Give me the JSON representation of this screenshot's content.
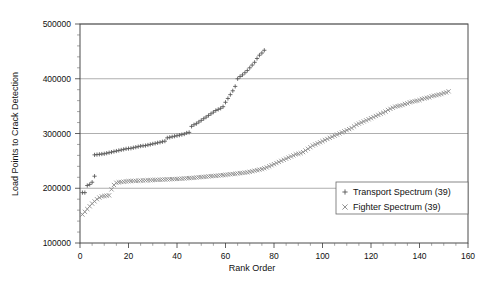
{
  "chart_data": {
    "type": "scatter",
    "title": "",
    "xlabel": "Rank Order",
    "ylabel": "Load Points to Crack Detection",
    "xlim": [
      0,
      160
    ],
    "ylim": [
      100000,
      500000
    ],
    "xticks": [
      0,
      20,
      40,
      60,
      80,
      100,
      120,
      140,
      160
    ],
    "xtick_labels": [
      "0",
      "20",
      "40",
      "60",
      "80",
      "100",
      "120",
      "140",
      "160"
    ],
    "yticks": [
      100000,
      200000,
      300000,
      400000,
      500000
    ],
    "ytick_labels": [
      "100000",
      "200000",
      "300000",
      "400000",
      "500000"
    ],
    "grid": "horizontal",
    "legend_position": "lower-right",
    "series": [
      {
        "name": "Transport Spectrum (39)",
        "marker": "plus",
        "color": "#555555",
        "count_label": "39",
        "points": [
          [
            1,
            192000
          ],
          [
            2,
            192000
          ],
          [
            3,
            205000
          ],
          [
            4,
            207000
          ],
          [
            5,
            211000
          ],
          [
            6,
            222000
          ],
          [
            6,
            261000
          ],
          [
            7,
            261500
          ],
          [
            8,
            262000
          ],
          [
            9,
            262500
          ],
          [
            10,
            263000
          ],
          [
            11,
            264000
          ],
          [
            12,
            265000
          ],
          [
            13,
            266000
          ],
          [
            14,
            267000
          ],
          [
            15,
            268000
          ],
          [
            16,
            269000
          ],
          [
            17,
            270000
          ],
          [
            18,
            271000
          ],
          [
            19,
            272000
          ],
          [
            20,
            272500
          ],
          [
            21,
            273000
          ],
          [
            22,
            274000
          ],
          [
            23,
            275000
          ],
          [
            24,
            276000
          ],
          [
            25,
            277000
          ],
          [
            26,
            277500
          ],
          [
            27,
            278000
          ],
          [
            28,
            279000
          ],
          [
            29,
            280000
          ],
          [
            30,
            281000
          ],
          [
            31,
            282000
          ],
          [
            32,
            283000
          ],
          [
            33,
            284000
          ],
          [
            34,
            285000
          ],
          [
            35,
            286000
          ],
          [
            36,
            292000
          ],
          [
            37,
            293000
          ],
          [
            38,
            294000
          ],
          [
            39,
            295000
          ],
          [
            40,
            296000
          ],
          [
            41,
            297000
          ],
          [
            42,
            298000
          ],
          [
            43,
            299000
          ],
          [
            44,
            301000
          ],
          [
            45,
            302000
          ],
          [
            46,
            313000
          ],
          [
            47,
            316000
          ],
          [
            48,
            318000
          ],
          [
            49,
            321000
          ],
          [
            50,
            324000
          ],
          [
            51,
            327000
          ],
          [
            52,
            330000
          ],
          [
            53,
            333000
          ],
          [
            54,
            336000
          ],
          [
            55,
            339000
          ],
          [
            56,
            342000
          ],
          [
            57,
            344000
          ],
          [
            58,
            346000
          ],
          [
            59,
            349000
          ],
          [
            60,
            357000
          ],
          [
            61,
            364000
          ],
          [
            62,
            371000
          ],
          [
            63,
            378000
          ],
          [
            64,
            386000
          ],
          [
            65,
            400000
          ],
          [
            66,
            404000
          ],
          [
            67,
            407000
          ],
          [
            68,
            411000
          ],
          [
            69,
            415000
          ],
          [
            70,
            420000
          ],
          [
            71,
            425000
          ],
          [
            72,
            430000
          ],
          [
            73,
            437000
          ],
          [
            74,
            443000
          ],
          [
            75,
            447000
          ],
          [
            76,
            452000
          ]
        ]
      },
      {
        "name": "Fighter Spectrum (39)",
        "marker": "cross",
        "color": "#888888",
        "count_label": "39",
        "points": [
          [
            1,
            152000
          ],
          [
            2,
            157000
          ],
          [
            3,
            162000
          ],
          [
            4,
            167000
          ],
          [
            5,
            172000
          ],
          [
            6,
            176000
          ],
          [
            7,
            180000
          ],
          [
            8,
            183000
          ],
          [
            9,
            185000
          ],
          [
            10,
            186000
          ],
          [
            11,
            186500
          ],
          [
            12,
            187000
          ],
          [
            13,
            198000
          ],
          [
            14,
            206000
          ],
          [
            15,
            210000
          ],
          [
            16,
            211000
          ],
          [
            17,
            211500
          ],
          [
            18,
            212000
          ],
          [
            19,
            212500
          ],
          [
            20,
            213000
          ],
          [
            21,
            213200
          ],
          [
            22,
            213400
          ],
          [
            23,
            213600
          ],
          [
            24,
            213800
          ],
          [
            25,
            214000
          ],
          [
            26,
            214200
          ],
          [
            27,
            214400
          ],
          [
            28,
            214600
          ],
          [
            29,
            214800
          ],
          [
            30,
            215000
          ],
          [
            31,
            215200
          ],
          [
            32,
            215400
          ],
          [
            33,
            215600
          ],
          [
            34,
            215800
          ],
          [
            35,
            216000
          ],
          [
            36,
            216200
          ],
          [
            37,
            216400
          ],
          [
            38,
            216600
          ],
          [
            39,
            216800
          ],
          [
            40,
            217000
          ],
          [
            41,
            217300
          ],
          [
            42,
            217600
          ],
          [
            43,
            217900
          ],
          [
            44,
            218200
          ],
          [
            45,
            218500
          ],
          [
            46,
            218800
          ],
          [
            47,
            219200
          ],
          [
            48,
            219600
          ],
          [
            49,
            220000
          ],
          [
            50,
            220400
          ],
          [
            51,
            220800
          ],
          [
            52,
            221200
          ],
          [
            53,
            221600
          ],
          [
            54,
            222000
          ],
          [
            55,
            222400
          ],
          [
            56,
            222800
          ],
          [
            57,
            223200
          ],
          [
            58,
            223600
          ],
          [
            59,
            224000
          ],
          [
            60,
            224500
          ],
          [
            61,
            225000
          ],
          [
            62,
            225500
          ],
          [
            63,
            226000
          ],
          [
            64,
            226500
          ],
          [
            65,
            227000
          ],
          [
            66,
            227500
          ],
          [
            67,
            228000
          ],
          [
            68,
            228500
          ],
          [
            69,
            229000
          ],
          [
            70,
            230000
          ],
          [
            71,
            231000
          ],
          [
            72,
            232000
          ],
          [
            73,
            233000
          ],
          [
            74,
            234000
          ],
          [
            75,
            235000
          ],
          [
            76,
            236500
          ],
          [
            77,
            238000
          ],
          [
            78,
            240000
          ],
          [
            79,
            242000
          ],
          [
            80,
            244000
          ],
          [
            81,
            246000
          ],
          [
            82,
            248000
          ],
          [
            83,
            250000
          ],
          [
            84,
            252000
          ],
          [
            85,
            254000
          ],
          [
            86,
            256000
          ],
          [
            87,
            258000
          ],
          [
            88,
            260000
          ],
          [
            89,
            262000
          ],
          [
            90,
            263000
          ],
          [
            91,
            264000
          ],
          [
            92,
            266000
          ],
          [
            93,
            269000
          ],
          [
            94,
            272000
          ],
          [
            95,
            275000
          ],
          [
            96,
            278000
          ],
          [
            97,
            280000
          ],
          [
            98,
            282000
          ],
          [
            99,
            284000
          ],
          [
            100,
            286000
          ],
          [
            101,
            288000
          ],
          [
            102,
            290000
          ],
          [
            103,
            292000
          ],
          [
            104,
            294000
          ],
          [
            105,
            296000
          ],
          [
            106,
            298000
          ],
          [
            107,
            300000
          ],
          [
            108,
            302000
          ],
          [
            109,
            304000
          ],
          [
            110,
            306000
          ],
          [
            111,
            308000
          ],
          [
            112,
            310000
          ],
          [
            113,
            313000
          ],
          [
            114,
            316000
          ],
          [
            115,
            318000
          ],
          [
            116,
            320000
          ],
          [
            117,
            322000
          ],
          [
            118,
            324000
          ],
          [
            119,
            326000
          ],
          [
            120,
            328000
          ],
          [
            121,
            330000
          ],
          [
            122,
            332000
          ],
          [
            123,
            334000
          ],
          [
            124,
            336000
          ],
          [
            125,
            338000
          ],
          [
            126,
            340000
          ],
          [
            127,
            343000
          ],
          [
            128,
            345000
          ],
          [
            129,
            347000
          ],
          [
            130,
            349000
          ],
          [
            131,
            350000
          ],
          [
            132,
            351000
          ],
          [
            133,
            352000
          ],
          [
            134,
            354000
          ],
          [
            135,
            355000
          ],
          [
            136,
            357000
          ],
          [
            137,
            358000
          ],
          [
            138,
            359000
          ],
          [
            139,
            360000
          ],
          [
            140,
            361000
          ],
          [
            141,
            363000
          ],
          [
            142,
            364000
          ],
          [
            143,
            365000
          ],
          [
            144,
            366000
          ],
          [
            145,
            368000
          ],
          [
            146,
            369000
          ],
          [
            147,
            370000
          ],
          [
            148,
            371000
          ],
          [
            149,
            372000
          ],
          [
            150,
            374000
          ],
          [
            151,
            375000
          ],
          [
            152,
            377000
          ]
        ]
      }
    ]
  },
  "legend": {
    "entries": [
      {
        "label": "Transport Spectrum (39)",
        "marker": "plus"
      },
      {
        "label": "Fighter Spectrum (39)",
        "marker": "cross"
      }
    ]
  }
}
